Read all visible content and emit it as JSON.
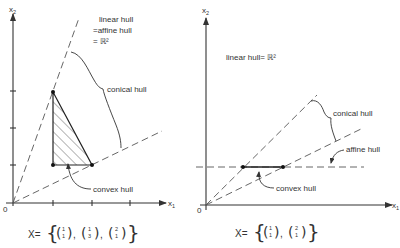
{
  "left_panel": {
    "axis_x_label": "x",
    "axis_x_sub": "1",
    "axis_y_label": "x",
    "axis_y_sub": "2",
    "origin_label": "0",
    "annotation_line1": "linear hull",
    "annotation_line2": "=affine hull",
    "annotation_line3": "= ℝ²",
    "conical_hull_label": "conical hull",
    "convex_hull_label": "convex hull",
    "set_prefix": "X=",
    "points": [
      {
        "x": 1,
        "y": 1
      },
      {
        "x": 1,
        "y": 3
      },
      {
        "x": 2,
        "y": 1
      }
    ],
    "set_vectors": [
      {
        "top": "1",
        "bottom": "1"
      },
      {
        "top": "1",
        "bottom": "3"
      },
      {
        "top": "2",
        "bottom": "1"
      }
    ]
  },
  "right_panel": {
    "axis_x_label": "x",
    "axis_x_sub": "1",
    "axis_y_label": "x",
    "axis_y_sub": "2",
    "origin_label": "0",
    "linear_hull_label": "linear hull= ℝ²",
    "conical_hull_label": "conical hull",
    "affine_hull_label": "affine hull",
    "convex_hull_label": "convex hull",
    "set_prefix": "X=",
    "points": [
      {
        "x": 1,
        "y": 1
      },
      {
        "x": 2,
        "y": 1
      }
    ],
    "set_vectors": [
      {
        "top": "1",
        "bottom": "1"
      },
      {
        "top": "2",
        "bottom": "1"
      }
    ]
  },
  "colors": {
    "ink": "#333333",
    "background": "#ffffff",
    "hatch": "#444444"
  }
}
